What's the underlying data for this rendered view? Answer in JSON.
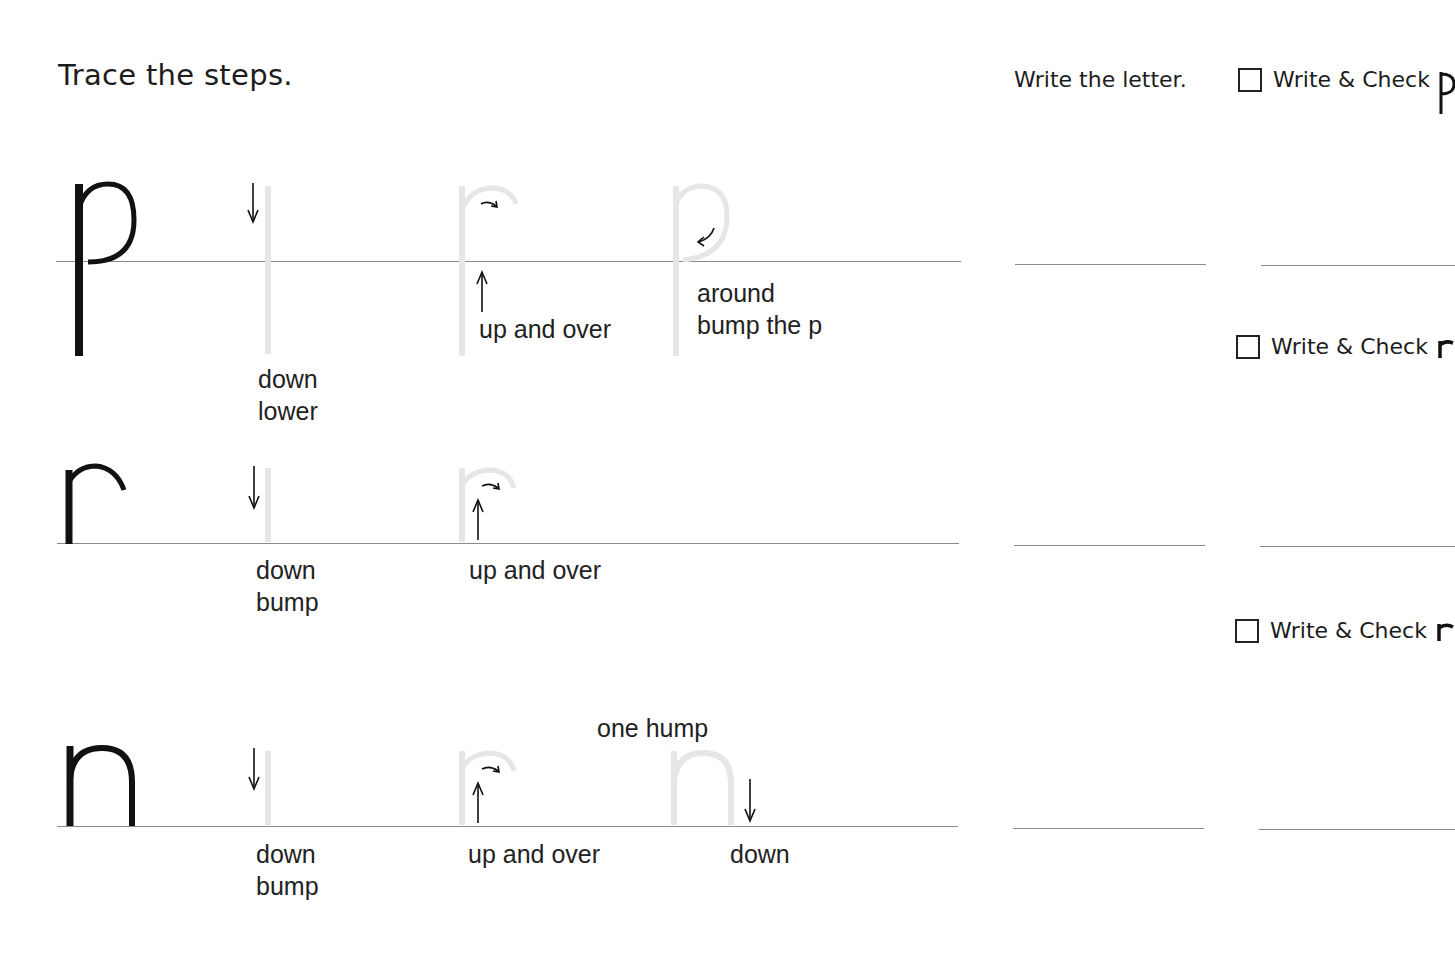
{
  "worksheet": {
    "title": "Trace the steps.",
    "write_header": "Write the letter.",
    "colors": {
      "ink": "#111111",
      "trace": "#e6e6e6",
      "line": "#8a8a8a"
    }
  },
  "rows": [
    {
      "letter": "p",
      "steps": [
        {
          "lines": [
            "down",
            "lower"
          ],
          "arrow": "down-arrow"
        },
        {
          "lines": [
            "up and over"
          ],
          "arrow": "up-arrow",
          "curve_arrow": "curved-right-arrow"
        },
        {
          "lines": [
            "around",
            "bump the p"
          ],
          "curve_arrow": "curved-down-left-arrow"
        }
      ],
      "write_check_label": "Write & Check",
      "write_check_letter": "p"
    },
    {
      "letter": "r",
      "steps": [
        {
          "lines": [
            "down",
            "bump"
          ],
          "arrow": "down-arrow"
        },
        {
          "lines": [
            "up and over"
          ],
          "arrow": "up-arrow",
          "curve_arrow": "curved-right-arrow"
        }
      ],
      "write_check_label": "Write & Check",
      "write_check_letter": "r"
    },
    {
      "letter": "n",
      "note": "one hump",
      "steps": [
        {
          "lines": [
            "down",
            "bump"
          ],
          "arrow": "down-arrow"
        },
        {
          "lines": [
            "up and over"
          ],
          "arrow": "up-arrow",
          "curve_arrow": "curved-right-arrow"
        },
        {
          "lines": [
            "down"
          ],
          "arrow": "down-arrow"
        }
      ],
      "write_check_label": "Write & Check",
      "write_check_letter": "n"
    }
  ]
}
